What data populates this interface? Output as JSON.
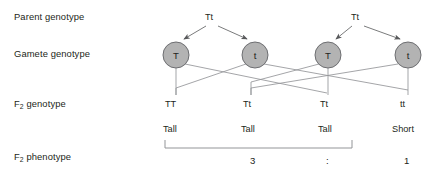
{
  "diagram": {
    "row_labels": [
      {
        "id": "parent-genotype",
        "text": "Parent genotype",
        "sub": ""
      },
      {
        "id": "gamete-genotype",
        "text": "Gamete genotype",
        "sub": ""
      },
      {
        "id": "f2-genotype",
        "prefix": "F",
        "sub": "2",
        "suffix": " genotype"
      },
      {
        "id": "f2-phenotype",
        "prefix": "F",
        "sub": "2",
        "suffix": " phenotype"
      }
    ],
    "parents": [
      {
        "id": "parent-left",
        "label": "Tt"
      },
      {
        "id": "parent-right",
        "label": "Tt"
      }
    ],
    "gametes": [
      {
        "id": "gamete-1",
        "label": "T"
      },
      {
        "id": "gamete-2",
        "label": "t"
      },
      {
        "id": "gamete-3",
        "label": "T"
      },
      {
        "id": "gamete-4",
        "label": "t"
      }
    ],
    "f2_genotypes": [
      "TT",
      "Tt",
      "Tt",
      "tt"
    ],
    "f2_phenotypes": [
      "Tall",
      "Tall",
      "Tall",
      "Short"
    ],
    "ratio": {
      "tall_count": "3",
      "separator": ":",
      "short_count": "1"
    },
    "colors": {
      "circle_fill": "#b3b3b3",
      "circle_stroke": "#6d6e71",
      "line": "#939598",
      "arrow": "#58595b",
      "text": "#231f20",
      "background": "#ffffff"
    }
  }
}
